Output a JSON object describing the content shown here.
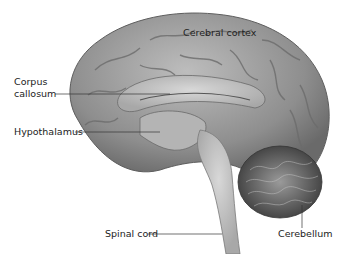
{
  "figure": {
    "labels": {
      "cerebral_cortex": "Cerebral cortex",
      "corpus_callosum_line1": "Corpus",
      "corpus_callosum_line2": "callosum",
      "hypothalamus": "Hypothalamus",
      "spinal_cord": "Spinal cord",
      "cerebellum": "Cerebellum"
    }
  }
}
